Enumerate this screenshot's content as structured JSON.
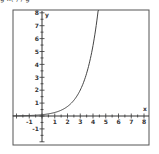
{
  "caption_fragment": "g   x( )        /        g",
  "chart_data": {
    "type": "line",
    "title": "",
    "function": "exponential growth (e.g. y = 0.1·e^x)",
    "xlabel": "x",
    "ylabel": "y",
    "xlim": [
      -2,
      8
    ],
    "ylim": [
      -2,
      8
    ],
    "x_ticks": [
      -1,
      1,
      2,
      3,
      4,
      5,
      6,
      7,
      8
    ],
    "y_ticks": [
      -1,
      1,
      2,
      3,
      4,
      5,
      6,
      7,
      8
    ],
    "grid": false,
    "legend": null,
    "series": [
      {
        "name": "curve",
        "x": [
          -2,
          -1,
          0,
          1,
          2,
          3,
          4,
          4.5,
          5
        ],
        "y": [
          0.01,
          0.04,
          0.1,
          0.27,
          0.74,
          2.0,
          5.46,
          9.0,
          14.8
        ]
      }
    ]
  },
  "labels": {
    "x_axis": "x",
    "y_axis": "y",
    "x_ticks": [
      "-1",
      "1",
      "2",
      "3",
      "4",
      "5",
      "6",
      "7",
      "8"
    ],
    "y_ticks": [
      "8",
      "7",
      "6",
      "5",
      "4",
      "3",
      "2",
      "1",
      "-1"
    ]
  }
}
